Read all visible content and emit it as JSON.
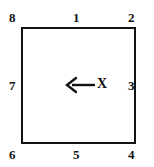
{
  "figure": {
    "line_color": "#121212",
    "background_color": "#ffffff",
    "shape": {
      "name": "square",
      "stroke_width_px": 2.5
    },
    "labels": {
      "top_left_corner": "8",
      "top_edge": "1",
      "top_right_corner": "2",
      "left_edge": "7",
      "right_edge": "3",
      "bottom_left_corner": "6",
      "bottom_edge": "5",
      "bottom_right_corner": "4"
    },
    "annotation": {
      "arrow_direction": "left",
      "arrow_label": "X"
    }
  }
}
